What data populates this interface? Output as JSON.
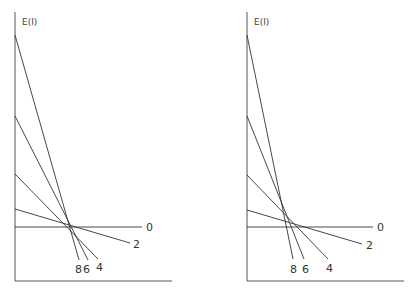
{
  "panels": [
    {
      "id": "left",
      "ylabel": "E(I)",
      "axis": {
        "x0": 15,
        "ytop": 12,
        "ybottom": 281,
        "xright": 172
      },
      "lines": [
        {
          "label": "0",
          "x1": 15,
          "y1": 227,
          "x2": 142,
          "y2": 227,
          "lx": 146,
          "ly": 231
        },
        {
          "label": "2",
          "x1": 15,
          "y1": 209,
          "x2": 130,
          "y2": 243,
          "lx": 133,
          "ly": 248
        },
        {
          "label": "4",
          "x1": 15,
          "y1": 174,
          "x2": 98,
          "y2": 259,
          "lx": 96,
          "ly": 263
        },
        {
          "label": "6",
          "x1": 15,
          "y1": 116,
          "x2": 88,
          "y2": 260,
          "lx": 83,
          "ly": 265
        },
        {
          "label": "8",
          "x1": 15,
          "y1": 35,
          "x2": 79,
          "y2": 260,
          "lx": 75,
          "ly": 265
        }
      ]
    },
    {
      "id": "right",
      "ylabel": "E(I)",
      "axis": {
        "x0": 247,
        "ytop": 12,
        "ybottom": 281,
        "xright": 404
      },
      "lines": [
        {
          "label": "0",
          "x1": 247,
          "y1": 227,
          "x2": 373,
          "y2": 227,
          "lx": 377,
          "ly": 231
        },
        {
          "label": "2",
          "x1": 247,
          "y1": 210,
          "x2": 362,
          "y2": 244,
          "lx": 366,
          "ly": 249
        },
        {
          "label": "4",
          "x1": 247,
          "y1": 175,
          "x2": 328,
          "y2": 259,
          "lx": 326,
          "ly": 264
        },
        {
          "label": "6",
          "x1": 247,
          "y1": 116,
          "x2": 304,
          "y2": 259,
          "lx": 302,
          "ly": 265
        },
        {
          "label": "8",
          "x1": 247,
          "y1": 35,
          "x2": 293,
          "y2": 259,
          "lx": 290,
          "ly": 265
        }
      ]
    }
  ]
}
